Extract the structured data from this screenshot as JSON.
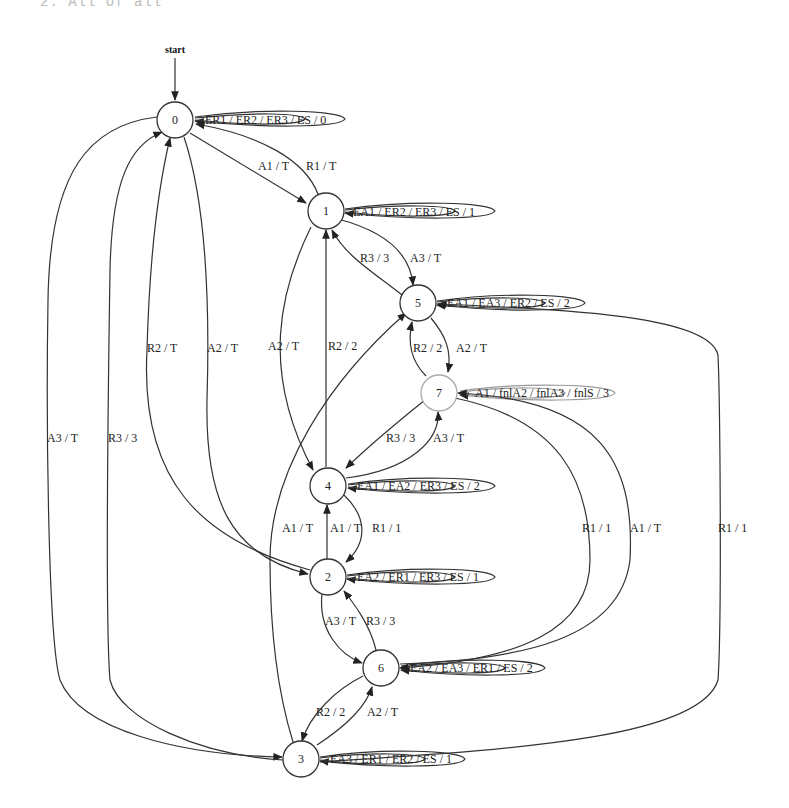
{
  "header": {
    "text": "2. All of all"
  },
  "diagram": {
    "start_label": "start",
    "nodes": [
      {
        "id": "0",
        "label": "0"
      },
      {
        "id": "1",
        "label": "1"
      },
      {
        "id": "2",
        "label": "2"
      },
      {
        "id": "3",
        "label": "3"
      },
      {
        "id": "4",
        "label": "4"
      },
      {
        "id": "5",
        "label": "5"
      },
      {
        "id": "6",
        "label": "6"
      },
      {
        "id": "7",
        "label": "7"
      }
    ],
    "self_loops": {
      "n0": "ER1 / ER2 / ER3 / ES / 0",
      "n1": "EA1 / ER2 / ER3 / ES / 1",
      "n5": "EA1 / EA3 / ER2 / ES / 2",
      "n7": "A1 / fnlA2 / fnlA3 / fnlS / 3",
      "n4": "EA1 / EA2 / ER3 / ES / 2",
      "n2": "EA2 / ER1 / ER3 / ES / 1",
      "n6": "EA2 / EA3 / ER1 / ES / 2",
      "n3": "EA3 / ER1 / ER2 / ES / 1"
    },
    "edges": {
      "e0_1": "A1 / T",
      "e1_0": "R1 / T",
      "e1_5": "A3 / T",
      "e5_1": "R3 / 3",
      "e5_7": "A2 / T",
      "e7_5": "R2 / 2",
      "e7_4": "R3 / 3",
      "e4_7": "A3 / T",
      "e1_4": "A2 / T",
      "e4_1": "R2 / 2",
      "e2_0": "R2 / T",
      "e0_2": "A2 / T",
      "e0_3": "A3 / T",
      "e3_0": "R3 / 3",
      "e3_5": "A1 / T",
      "e2_4": "A1 / T",
      "e4_2": "R1 / 1",
      "e2_6": "A3 / T",
      "e6_2": "R3 / 3",
      "e6_3": "R2 / 2",
      "e3_6": "A2 / T",
      "e7_6": "R1 / 1",
      "e6_7": "A1 / T",
      "e3_5_r": "R1 / 1"
    }
  }
}
